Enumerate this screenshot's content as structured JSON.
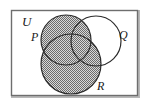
{
  "figure": {
    "type": "venn-diagram",
    "shaded_region": "P union R",
    "unshaded_region": "Q minus (P union R)"
  },
  "labels": {
    "universe": "U",
    "set_p": "P",
    "set_q": "Q",
    "set_r": "R"
  },
  "colors": {
    "outline": "#2b2b2b",
    "border": "#6e6e6e",
    "shade_dark": "#6b6b6b",
    "shade_light": "#d8d8d8",
    "background": "#ffffff",
    "label": "#1a1a1a"
  },
  "geometry": {
    "rect": {
      "x": 11,
      "y": 10,
      "width": 127,
      "height": 86
    },
    "circle_p": {
      "cx": 66,
      "cy": 40,
      "r": 25
    },
    "circle_q": {
      "cx": 96,
      "cy": 41,
      "r": 25
    },
    "circle_r": {
      "cx": 71,
      "cy": 64,
      "r": 30
    }
  },
  "label_positions": {
    "universe": {
      "x": 22,
      "y": 26
    },
    "set_p": {
      "x": 31,
      "y": 41
    },
    "set_q": {
      "x": 119,
      "y": 39
    },
    "set_r": {
      "x": 97,
      "y": 90
    }
  }
}
